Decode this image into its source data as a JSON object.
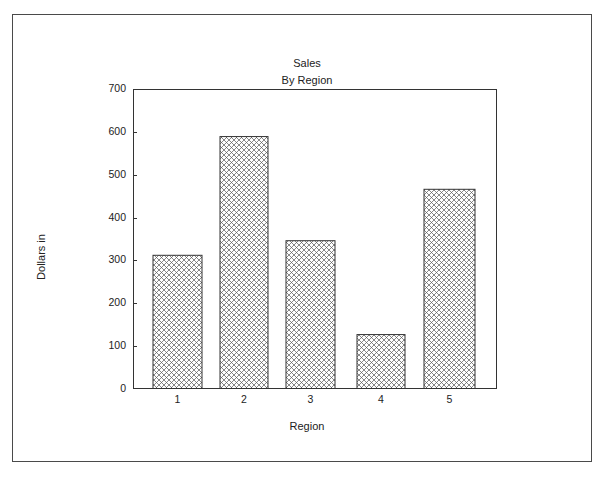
{
  "chart_data": {
    "type": "bar",
    "title": "Sales",
    "subtitle": "By Region",
    "xlabel": "Region",
    "ylabel": "Dollars in",
    "categories": [
      "1",
      "2",
      "3",
      "4",
      "5"
    ],
    "values": [
      312,
      589,
      346,
      127,
      466
    ],
    "ylim": [
      0,
      700
    ],
    "yticks": [
      0,
      100,
      200,
      300,
      400,
      500,
      600,
      700
    ],
    "grid": false,
    "legend": null,
    "bar_fill": "cross-hatch",
    "bar_color": "#333333"
  }
}
